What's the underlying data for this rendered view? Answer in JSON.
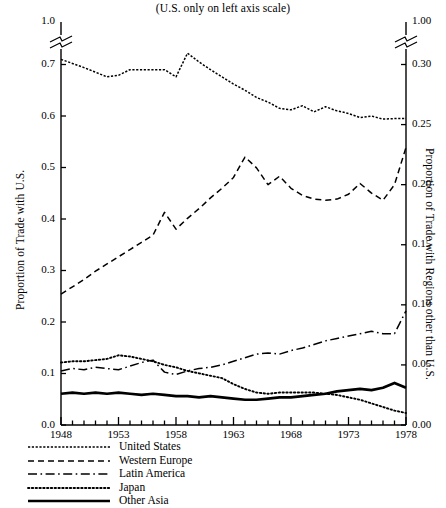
{
  "subtitle": "(U.S. only on left axis scale)",
  "axes": {
    "left_title": "Proportion of Trade with U.S.",
    "right_title": "Proportion of Trade with Regions other than U.S.",
    "left_ticks": [
      "0.0",
      "0.1",
      "0.2",
      "0.3",
      "0.4",
      "0.5",
      "0.6",
      "0.7",
      "1.0"
    ],
    "right_ticks": [
      "0.00",
      "0.05",
      "0.10",
      "0.15",
      "0.20",
      "0.25",
      "0.30",
      "1.00"
    ],
    "x_ticks": [
      "1948",
      "1953",
      "1958",
      "1963",
      "1968",
      "1973",
      "1978"
    ]
  },
  "legend": [
    {
      "name": "United States",
      "style": "fine-dot"
    },
    {
      "name": "Western Europe",
      "style": "dashed"
    },
    {
      "name": "Latin America",
      "style": "dash-dot"
    },
    {
      "name": "Japan",
      "style": "dotted"
    },
    {
      "name": "Other Asia",
      "style": "solid"
    }
  ],
  "chart_data": {
    "type": "line",
    "title": "",
    "subtitle": "(U.S. only on left axis scale)",
    "xlabel": "",
    "ylabel": "Proportion of Trade with U.S.",
    "ylabel_right": "Proportion of Trade with Regions other than U.S.",
    "xlim": [
      1948,
      1978
    ],
    "ylim": [
      0.0,
      0.7
    ],
    "ylim_right": [
      0.0,
      0.3
    ],
    "y_axis_break": {
      "left_above_break": "1.0",
      "right_above_break": "1.00"
    },
    "grid": false,
    "legend_position": "below-left",
    "note": "United States series is read on the left axis (0.0-0.7); all other series are read on the right axis (0.00-0.30). Left-axis pixel scale is shared, so right-axis values equal left-axis values multiplied by 3/7.",
    "x": [
      1948,
      1949,
      1950,
      1951,
      1952,
      1953,
      1954,
      1955,
      1956,
      1957,
      1958,
      1959,
      1960,
      1961,
      1962,
      1963,
      1964,
      1965,
      1966,
      1967,
      1968,
      1969,
      1970,
      1971,
      1972,
      1973,
      1974,
      1975,
      1976,
      1977,
      1978
    ],
    "series": [
      {
        "name": "United States",
        "axis": "left",
        "style": "fine-dot",
        "values": [
          0.71,
          0.702,
          0.694,
          0.685,
          0.676,
          0.679,
          0.69,
          0.69,
          0.69,
          0.69,
          0.676,
          0.722,
          0.705,
          0.69,
          0.676,
          0.662,
          0.65,
          0.636,
          0.627,
          0.615,
          0.612,
          0.62,
          0.608,
          0.618,
          0.61,
          0.605,
          0.597,
          0.6,
          0.594,
          0.595,
          0.595
        ]
      },
      {
        "name": "Western Europe",
        "axis": "right",
        "style": "dashed",
        "values": [
          0.109,
          0.115,
          0.121,
          0.128,
          0.134,
          0.14,
          0.146,
          0.152,
          0.158,
          0.177,
          0.163,
          0.172,
          0.18,
          0.189,
          0.197,
          0.206,
          0.223,
          0.214,
          0.2,
          0.207,
          0.197,
          0.191,
          0.188,
          0.187,
          0.188,
          0.192,
          0.201,
          0.193,
          0.187,
          0.2,
          0.231
        ]
      },
      {
        "name": "Latin America",
        "axis": "right",
        "style": "dash-dot",
        "values": [
          0.045,
          0.047,
          0.046,
          0.048,
          0.047,
          0.046,
          0.049,
          0.052,
          0.054,
          0.044,
          0.042,
          0.045,
          0.047,
          0.048,
          0.05,
          0.053,
          0.056,
          0.059,
          0.06,
          0.059,
          0.062,
          0.064,
          0.067,
          0.07,
          0.072,
          0.074,
          0.076,
          0.078,
          0.076,
          0.076,
          0.095
        ]
      },
      {
        "name": "Japan",
        "axis": "right",
        "style": "dotted",
        "values": [
          0.052,
          0.053,
          0.053,
          0.054,
          0.055,
          0.058,
          0.057,
          0.055,
          0.053,
          0.05,
          0.048,
          0.045,
          0.043,
          0.041,
          0.039,
          0.034,
          0.03,
          0.027,
          0.026,
          0.027,
          0.027,
          0.027,
          0.027,
          0.026,
          0.025,
          0.023,
          0.021,
          0.018,
          0.015,
          0.012,
          0.01
        ]
      },
      {
        "name": "Other Asia",
        "axis": "right",
        "style": "solid",
        "values": [
          0.026,
          0.027,
          0.026,
          0.027,
          0.026,
          0.027,
          0.026,
          0.025,
          0.026,
          0.025,
          0.024,
          0.024,
          0.023,
          0.024,
          0.023,
          0.022,
          0.021,
          0.021,
          0.022,
          0.023,
          0.023,
          0.024,
          0.025,
          0.026,
          0.028,
          0.029,
          0.03,
          0.029,
          0.031,
          0.035,
          0.031
        ]
      }
    ]
  }
}
